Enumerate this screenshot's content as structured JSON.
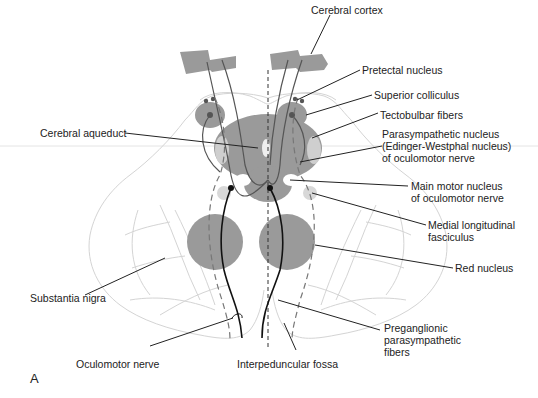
{
  "figure": {
    "panel_letter": "A",
    "colors": {
      "structure_gray": "#9a9a9a",
      "light_gray": "#cfcfcf",
      "outline_gray": "#d6d6d6",
      "line_dark": "#222222",
      "background": "#ffffff"
    },
    "labels": {
      "cerebral_cortex": "Cerebral cortex",
      "pretectal_nucleus": "Pretectal nucleus",
      "superior_colliculus": "Superior colliculus",
      "tectobulbar_fibers": "Tectobulbar fibers",
      "parasympathetic_nucleus": "Parasympathetic nucleus\n(Edinger-Westphal nucleus)\nof oculomotor nerve",
      "main_motor_nucleus": "Main motor nucleus\nof oculomotor nerve",
      "medial_longitudinal_fasciculus": "Medial longitudinal\nfasciculus",
      "red_nucleus": "Red nucleus",
      "preganglionic_fibers": "Preganglionic\nparasympathetic\nfibers",
      "interpeduncular_fossa": "Interpeduncular fossa",
      "oculomotor_nerve": "Oculomotor nerve",
      "substantia_nigra": "Substantia nigra",
      "cerebral_aqueduct": "Cerebral aqueduct"
    }
  }
}
